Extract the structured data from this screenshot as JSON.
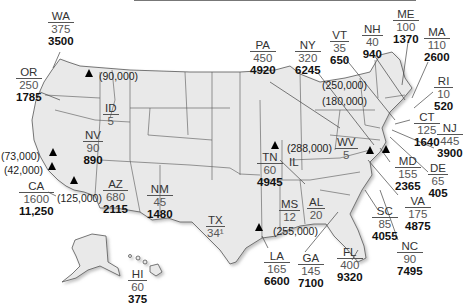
{
  "map": {
    "states": [
      {
        "abbr": "WA",
        "v1": "375",
        "v2": "3500",
        "x": 48,
        "y": 10
      },
      {
        "abbr": "OR",
        "v1": "250",
        "v2": "1785",
        "x": 16,
        "y": 66
      },
      {
        "abbr": "ID",
        "v1": "5",
        "v2": "",
        "x": 103,
        "y": 102
      },
      {
        "abbr": "NV",
        "v1": "90",
        "v2": "890",
        "x": 83,
        "y": 129
      },
      {
        "abbr": "CA",
        "v1": "1600",
        "v2": "11,250",
        "x": 19,
        "y": 180
      },
      {
        "abbr": "AZ",
        "v1": "680",
        "v2": "2115",
        "x": 103,
        "y": 178
      },
      {
        "abbr": "NM",
        "v1": "45",
        "v2": "1480",
        "x": 147,
        "y": 183
      },
      {
        "abbr": "TX",
        "v1": "34¹",
        "v2": "",
        "x": 206,
        "y": 214
      },
      {
        "abbr": "HI",
        "v1": "60",
        "v2": "375",
        "x": 128,
        "y": 268
      },
      {
        "abbr": "PA",
        "v1": "450",
        "v2": "4920",
        "x": 250,
        "y": 39
      },
      {
        "abbr": "NY",
        "v1": "320",
        "v2": "6245",
        "x": 295,
        "y": 39
      },
      {
        "abbr": "VT",
        "v1": "35",
        "v2": "650",
        "x": 330,
        "y": 29
      },
      {
        "abbr": "NH",
        "v1": "40",
        "v2": "940",
        "x": 362,
        "y": 23
      },
      {
        "abbr": "ME",
        "v1": "100",
        "v2": "1370",
        "x": 393,
        "y": 8
      },
      {
        "abbr": "MA",
        "v1": "110",
        "v2": "2600",
        "x": 424,
        "y": 26
      },
      {
        "abbr": "RI",
        "v1": "10",
        "v2": "520",
        "x": 434,
        "y": 75
      },
      {
        "abbr": "CT",
        "v1": "125",
        "v2": "1640",
        "x": 414,
        "y": 111
      },
      {
        "abbr": "NJ",
        "v1": "445",
        "v2": "3900",
        "x": 437,
        "y": 122
      },
      {
        "abbr": "WV",
        "v1": "5",
        "v2": "",
        "x": 335,
        "y": 136
      },
      {
        "abbr": "MD",
        "v1": "155",
        "v2": "2365",
        "x": 395,
        "y": 155
      },
      {
        "abbr": "DE",
        "v1": "65",
        "v2": "405",
        "x": 428,
        "y": 162
      },
      {
        "abbr": "VA",
        "v1": "175",
        "v2": "4875",
        "x": 405,
        "y": 195
      },
      {
        "abbr": "SC",
        "v1": "85",
        "v2": "4055",
        "x": 372,
        "y": 205
      },
      {
        "abbr": "NC",
        "v1": "90",
        "v2": "7495",
        "x": 397,
        "y": 240
      },
      {
        "abbr": "TN",
        "v1": "60",
        "v2": "4945",
        "x": 257,
        "y": 151
      },
      {
        "abbr": "IL",
        "v1": "",
        "v2": "",
        "x": 287,
        "y": 156
      },
      {
        "abbr": "MS",
        "v1": "12",
        "v2": "",
        "x": 279,
        "y": 198
      },
      {
        "abbr": "AL",
        "v1": "20",
        "v2": "",
        "x": 307,
        "y": 196
      },
      {
        "abbr": "LA",
        "v1": "165",
        "v2": "6600",
        "x": 264,
        "y": 250
      },
      {
        "abbr": "GA",
        "v1": "145",
        "v2": "7100",
        "x": 298,
        "y": 252
      },
      {
        "abbr": "FL",
        "v1": "400",
        "v2": "9320",
        "x": 337,
        "y": 246
      }
    ],
    "markers": [
      {
        "label": "(90,000)",
        "tx": 89,
        "ty": 73,
        "lx": 99,
        "ly": 70
      },
      {
        "label": "(73,000)",
        "tx": 53,
        "ty": 152,
        "lx": 1,
        "ly": 150
      },
      {
        "label": "(42,000)",
        "tx": 52,
        "ty": 166,
        "lx": 4,
        "ly": 164
      },
      {
        "label": "(125,000)",
        "tx": 74,
        "ty": 180,
        "lx": 57,
        "ly": 192
      },
      {
        "label": "(288,000)",
        "tx": 275,
        "ty": 145,
        "lx": 287,
        "ly": 142
      },
      {
        "label": "(255,000)",
        "tx": 259,
        "ty": 227,
        "lx": 273,
        "ly": 225
      },
      {
        "label": "(250,000)",
        "tx": 370,
        "ty": 150,
        "lx": 322,
        "ly": 79
      },
      {
        "label": "(180,000)",
        "tx": 386,
        "ty": 149,
        "lx": 322,
        "ly": 95
      }
    ]
  }
}
